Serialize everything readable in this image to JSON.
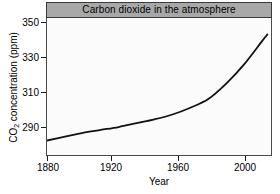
{
  "chart_data": {
    "type": "line",
    "title": "Carbon dioxide in the atmosphere",
    "xlabel": "Year",
    "ylabel_prefix": "CO",
    "ylabel_sub": "2",
    "ylabel_suffix": " concentration (ppm)",
    "ylabel_full": "CO2 concentration (ppm)",
    "xlim": [
      1880,
      2005
    ],
    "ylim": [
      285,
      356
    ],
    "xticks": [
      1880,
      1920,
      1960,
      2000
    ],
    "xtick_labels": [
      "1880",
      "1920",
      "1960",
      "2000"
    ],
    "yticks": [
      290,
      310,
      330,
      350
    ],
    "ytick_labels": [
      "290",
      "310",
      "330",
      "350"
    ],
    "grid": false,
    "legend": false,
    "line_color": "#111111",
    "line_width": 1.8,
    "title_bar_color": "#a8a8a8",
    "plot_background": "#fbfbfb",
    "frame_color": "#4a4a4a",
    "series": [
      {
        "name": "CO2 concentration",
        "x": [
          1880,
          1890,
          1900,
          1910,
          1920,
          1930,
          1940,
          1950,
          1960,
          1970,
          1980,
          1990,
          2000,
          2003
        ],
        "values": [
          292.5,
          294.5,
          296.5,
          298.0,
          299.5,
          301.5,
          303.5,
          306.0,
          309.5,
          314.0,
          322.0,
          332.0,
          344.0,
          347.5
        ]
      }
    ]
  },
  "figure": {
    "title": "Carbon dioxide in the atmosphere"
  }
}
